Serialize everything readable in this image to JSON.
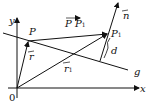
{
  "diagram": {
    "type": "vector-geometry",
    "labels": {
      "y_axis": "y",
      "x_axis": "x",
      "origin": "0",
      "point_p": "P",
      "point_p1": "P",
      "p1_sub": "1",
      "vec_pp1": "P P",
      "vec_pp1_sub": "1",
      "vec_r": "r",
      "vec_r1": "r",
      "vec_r1_sub": "1",
      "normal": "n",
      "distance": "d",
      "line": "g"
    },
    "color": "#111111"
  }
}
